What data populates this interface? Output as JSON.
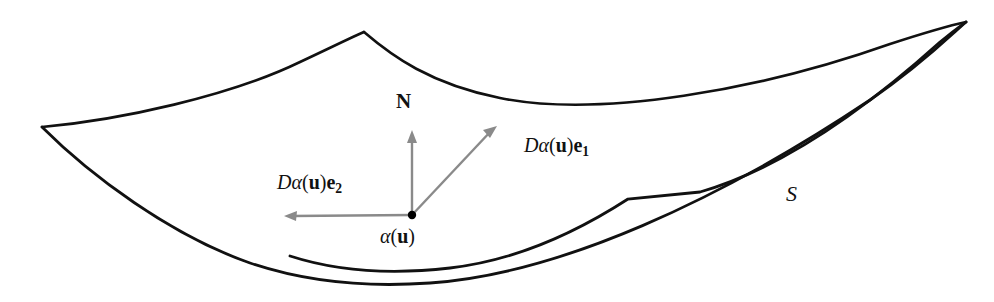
{
  "figure": {
    "kind": "geometry-diagram",
    "background_color": "#ffffff",
    "curve_color": "#111111",
    "arrow_color": "#8a8a8a",
    "point_color": "#000000",
    "labels": {
      "normal_vector": "N",
      "tangent_e1": {
        "D": "D",
        "alpha": "α",
        "open": "(",
        "u": "u",
        "close": ")",
        "e": "e",
        "index": "1",
        "full": "Dα(u)e₁"
      },
      "tangent_e2": {
        "D": "D",
        "alpha": "α",
        "open": "(",
        "u": "u",
        "close": ")",
        "e": "e",
        "index": "2",
        "full": "Dα(u)e₂"
      },
      "base_point": {
        "alpha": "α",
        "open": "(",
        "u": "u",
        "close": ")",
        "full": "α(u)"
      },
      "surface": "S"
    },
    "geometry": {
      "base_point_xy": [
        412,
        215
      ],
      "normal_tip_xy": [
        412,
        130
      ],
      "e1_tip_xy": [
        497,
        126
      ],
      "e2_tip_xy": [
        284,
        216
      ],
      "top_apex_xy": [
        364,
        32
      ],
      "left_corner_xy": [
        42,
        127
      ],
      "right_corner_xy": [
        966,
        22
      ],
      "kink_xy": [
        628,
        199
      ]
    }
  }
}
